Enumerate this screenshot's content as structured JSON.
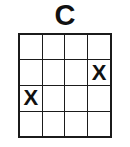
{
  "diagram": {
    "title": "C",
    "type": "chord-grid",
    "rows": 4,
    "columns": 4,
    "colors": {
      "background": "#ffffff",
      "line": "#1b1b1b",
      "text": "#111111"
    },
    "mark_symbol": "X",
    "empty_symbol": "",
    "cells": [
      [
        "",
        "",
        "",
        ""
      ],
      [
        "",
        "",
        "",
        "X"
      ],
      [
        "X",
        "",
        "",
        ""
      ],
      [
        "",
        "",
        "",
        ""
      ]
    ],
    "marked_positions": [
      {
        "row": 2,
        "column": 4,
        "symbol": "X"
      },
      {
        "row": 3,
        "column": 1,
        "symbol": "X"
      }
    ]
  }
}
